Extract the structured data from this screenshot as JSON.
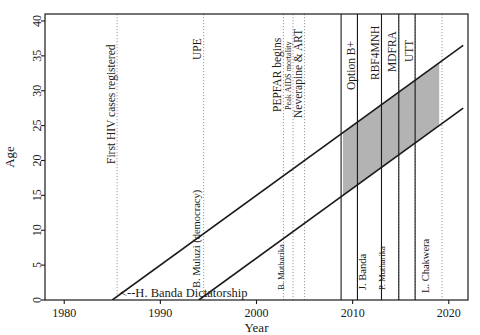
{
  "chart_data": {
    "type": "line",
    "title": "",
    "xlabel": "Year",
    "ylabel": "Age",
    "xlim": [
      1978,
      2022
    ],
    "ylim": [
      0,
      41
    ],
    "grid": false,
    "legend": "none",
    "x_ticks": [
      1980,
      1990,
      2000,
      2010,
      2020
    ],
    "y_ticks": [
      0,
      5,
      10,
      15,
      20,
      25,
      30,
      35,
      40
    ],
    "series": [
      {
        "name": "upper-cohort-boundary",
        "style": "solid",
        "points": [
          [
            1985,
            0
          ],
          [
            2021.5,
            36.5
          ]
        ]
      },
      {
        "name": "lower-cohort-boundary",
        "style": "solid",
        "points": [
          [
            1994,
            0
          ],
          [
            2021.5,
            27.5
          ]
        ]
      }
    ],
    "shaded_band": {
      "label": "highlighted cohort window",
      "color": "#b3b3b3",
      "x_start": 2009.0,
      "x_end": 2019.0,
      "note": "parallelogram bounded above and below by the two cohort lines"
    },
    "event_lines": [
      {
        "label": "First HIV cases registered",
        "year": 1985.5,
        "style": "dotted"
      },
      {
        "label": "UPE",
        "year": 1994.5,
        "style": "dotted"
      },
      {
        "label": "PEPFAR begins",
        "year": 2002.8,
        "style": "dotted"
      },
      {
        "label": "Peak AIDS mortality",
        "year": 2003.8,
        "style": "dotted"
      },
      {
        "label": "Neverapine & ART",
        "year": 2005.0,
        "style": "dotted"
      },
      {
        "label": "Option B+",
        "year": 2010.5,
        "style": "dotted"
      },
      {
        "label": "RBF4MNH",
        "year": 2013.0,
        "style": "dotted"
      },
      {
        "label": "MDFRA",
        "year": 2014.8,
        "style": "dotted"
      },
      {
        "label": "UTT",
        "year": 2016.5,
        "style": "dotted"
      },
      {
        "label": "",
        "year": 2019.3,
        "style": "dotted"
      }
    ],
    "regime_lines": [
      {
        "year": 2008.8,
        "style": "solid"
      },
      {
        "year": 2010.5,
        "style": "solid"
      },
      {
        "year": 2013.0,
        "style": "solid"
      },
      {
        "year": 2014.8,
        "style": "solid"
      },
      {
        "year": 2016.5,
        "style": "solid"
      }
    ],
    "leaders": [
      {
        "name": "<--H. Banda Dictatorship",
        "orientation": "horizontal",
        "x": 1985.8,
        "y": 0.4
      },
      {
        "name": "B. Muluzi (democracy)",
        "orientation": "vertical",
        "year": 1994.4
      },
      {
        "name": "B. Mutharika",
        "orientation": "vertical",
        "year": 2003.1
      },
      {
        "name": "J. Banda",
        "orientation": "vertical",
        "year": 2011.6
      },
      {
        "name": "P. Mutharika",
        "orientation": "vertical",
        "year": 2013.6
      },
      {
        "name": "L. Chakwera",
        "orientation": "vertical",
        "year": 2018.2
      }
    ],
    "colors": {
      "line": "#1a1a1a",
      "band": "#b3b3b3",
      "dotted": "#9a9a9a",
      "axis": "#1a1a1a",
      "background": "#ffffff"
    }
  }
}
